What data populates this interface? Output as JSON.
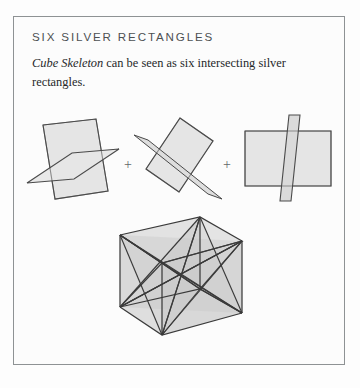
{
  "panel": {
    "title": "SIX SILVER RECTANGLES",
    "body_italic": "Cube Skeleton",
    "body_rest": " can be seen as six intersecting silver rectangles.",
    "border_color": "#8e9294",
    "background_color": "#fcfcfc",
    "title_color": "#4c5052",
    "body_color": "#26282a"
  },
  "operators": {
    "plus_1": "+",
    "plus_2": "+"
  },
  "figures": {
    "fig_1_name": "two-intersecting-silver-rectangles-pair-one",
    "fig_2_name": "two-intersecting-silver-rectangles-pair-two",
    "fig_3_name": "two-intersecting-silver-rectangles-pair-three",
    "cube_name": "cube-skeleton-composite",
    "fill_color": "#e3e3e3",
    "stroke_color": "#4a4a4a",
    "cube_stroke_color": "#3a3a3a"
  }
}
